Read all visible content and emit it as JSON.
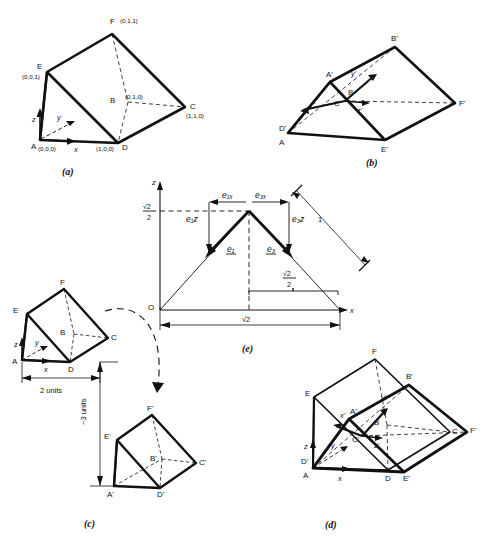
{
  "figure": {
    "panels": [
      {
        "id": "a",
        "label": "(a)",
        "caption": "Original unit prism in xyz coordinates",
        "axes": [
          "x",
          "y",
          "z"
        ],
        "vertices": [
          {
            "name": "A",
            "coords": "(0,0,0)"
          },
          {
            "name": "B",
            "coords": "(0,1,0)"
          },
          {
            "name": "C",
            "coords": "(1,1,0)"
          },
          {
            "name": "D",
            "coords": "(1,0,0)"
          },
          {
            "name": "E",
            "coords": "(0,0,1)"
          },
          {
            "name": "F",
            "coords": "(0,1,1)"
          }
        ]
      },
      {
        "id": "b",
        "label": "(b)",
        "caption": "Rotated prism with primed axes",
        "axes": [
          "x'",
          "y'",
          "z'"
        ],
        "vertices": [
          {
            "name": "A",
            "coords": ""
          },
          {
            "name": "A'",
            "coords": ""
          },
          {
            "name": "B",
            "coords": ""
          },
          {
            "name": "B'",
            "coords": ""
          },
          {
            "name": "C'",
            "coords": ""
          },
          {
            "name": "D'",
            "coords": ""
          },
          {
            "name": "E'",
            "coords": ""
          },
          {
            "name": "F'",
            "coords": ""
          }
        ]
      },
      {
        "id": "c",
        "label": "(c)",
        "caption": "Translated prism",
        "axes": [
          "x",
          "y",
          "z"
        ],
        "vertices": [
          {
            "name": "A",
            "coords": ""
          },
          {
            "name": "B",
            "coords": ""
          },
          {
            "name": "C",
            "coords": ""
          },
          {
            "name": "D",
            "coords": ""
          },
          {
            "name": "E",
            "coords": ""
          },
          {
            "name": "F",
            "coords": ""
          },
          {
            "name": "A'",
            "coords": ""
          },
          {
            "name": "B'",
            "coords": ""
          },
          {
            "name": "C'",
            "coords": ""
          },
          {
            "name": "D'",
            "coords": ""
          },
          {
            "name": "E'",
            "coords": ""
          },
          {
            "name": "F'",
            "coords": ""
          }
        ],
        "dimensions": [
          {
            "name": "horizontal-offset",
            "value": "2 units"
          },
          {
            "name": "vertical-offset",
            "value": "−3 units"
          }
        ]
      },
      {
        "id": "d",
        "label": "(d)",
        "caption": "Superimposed original and transformed prism",
        "axes": [
          "x",
          "y",
          "z",
          "x'",
          "y'",
          "z'"
        ],
        "vertices": [
          {
            "name": "A",
            "coords": ""
          },
          {
            "name": "B",
            "coords": ""
          },
          {
            "name": "C",
            "coords": ""
          },
          {
            "name": "D",
            "coords": ""
          },
          {
            "name": "E",
            "coords": ""
          },
          {
            "name": "F",
            "coords": ""
          },
          {
            "name": "A'",
            "coords": ""
          },
          {
            "name": "B'",
            "coords": ""
          },
          {
            "name": "C'",
            "coords": ""
          },
          {
            "name": "D'",
            "coords": ""
          },
          {
            "name": "E'",
            "coords": ""
          },
          {
            "name": "F'",
            "coords": ""
          }
        ]
      },
      {
        "id": "e",
        "label": "(e)",
        "caption": "Unit-vector components in the x–z plane",
        "origin": "O",
        "axis_x": "x",
        "axis_z": "z",
        "z_tick": {
          "num": "√2",
          "den": "2"
        },
        "vectors": [
          {
            "name": "e1",
            "label": "e₁"
          },
          {
            "name": "e3",
            "label": "e₃"
          }
        ],
        "components": [
          {
            "name": "e1x",
            "label": "e₁ₓ"
          },
          {
            "name": "e3x",
            "label": "e₃ₓ"
          },
          {
            "name": "e1z",
            "label": "e₁z"
          },
          {
            "name": "e3z",
            "label": "e₃z"
          }
        ],
        "dimensions": [
          {
            "name": "hypotenuse",
            "value": "1"
          },
          {
            "name": "half-base",
            "num": "√2",
            "den": "2"
          },
          {
            "name": "full-base",
            "value": "√2"
          }
        ]
      }
    ]
  }
}
